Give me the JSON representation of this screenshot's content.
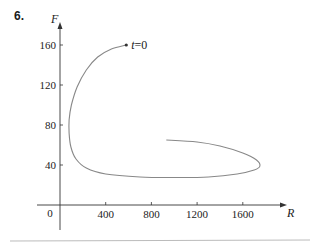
{
  "problem_number": "6.",
  "chart_data": {
    "type": "line",
    "title": "",
    "xlabel": "R",
    "ylabel": "F",
    "xlim": [
      0,
      1900
    ],
    "ylim": [
      0,
      175
    ],
    "x_ticks": [
      400,
      800,
      1200,
      1600
    ],
    "y_ticks": [
      40,
      80,
      120,
      160
    ],
    "origin_label": "0",
    "grid": false,
    "legend": null,
    "annotations": [
      {
        "text": "t = 0",
        "x": 580,
        "y": 160
      }
    ],
    "series": [
      {
        "name": "phase trajectory",
        "points": [
          [
            580,
            160
          ],
          [
            450,
            156
          ],
          [
            330,
            148
          ],
          [
            230,
            135
          ],
          [
            150,
            118
          ],
          [
            100,
            100
          ],
          [
            80,
            85
          ],
          [
            80,
            72
          ],
          [
            95,
            58
          ],
          [
            140,
            46
          ],
          [
            230,
            37
          ],
          [
            400,
            31
          ],
          [
            700,
            28
          ],
          [
            1000,
            27.5
          ],
          [
            1300,
            28
          ],
          [
            1550,
            31
          ],
          [
            1700,
            35
          ],
          [
            1750,
            39
          ],
          [
            1720,
            45
          ],
          [
            1600,
            52
          ],
          [
            1400,
            59
          ],
          [
            1200,
            63
          ],
          [
            930,
            65
          ]
        ]
      }
    ]
  }
}
